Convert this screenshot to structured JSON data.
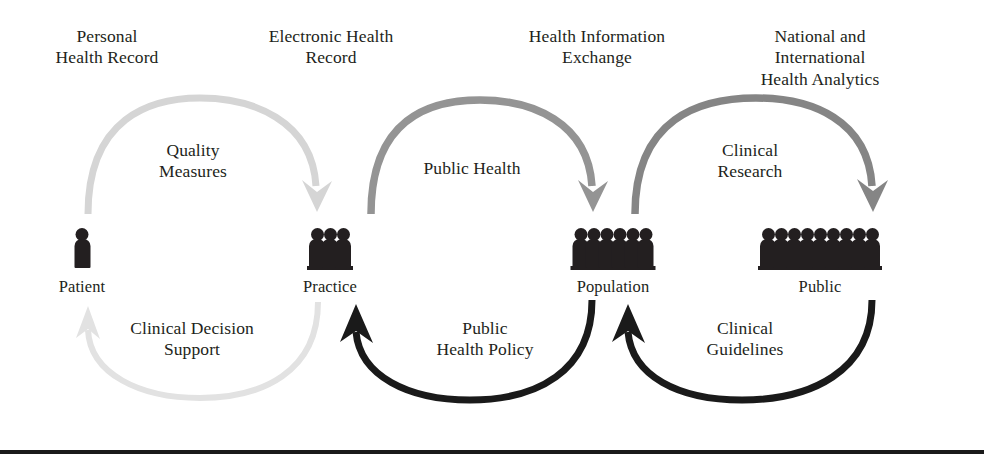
{
  "diagram": {
    "width": 984,
    "height": 463,
    "background": "#ffffff",
    "text_color": "#231f20",
    "rule_color": "#1a1a1a"
  },
  "tier_labels": [
    {
      "text": "Personal\nHealth Record",
      "x": 107,
      "y": 26
    },
    {
      "text": "Electronic Health\nRecord",
      "x": 331,
      "y": 26
    },
    {
      "text": "Health Information\nExchange",
      "x": 597,
      "y": 26
    },
    {
      "text": "National and International\nHealth Analytics",
      "x": 820,
      "y": 26
    }
  ],
  "flow_labels_forward": [
    {
      "text": "Quality\nMeasures",
      "x": 193,
      "y": 140
    },
    {
      "text": "Public Health",
      "x": 472,
      "y": 158
    },
    {
      "text": "Clinical\nResearch",
      "x": 750,
      "y": 140
    }
  ],
  "flow_labels_return": [
    {
      "text": "Clinical Decision\nSupport",
      "x": 192,
      "y": 318
    },
    {
      "text": "Public\nHealth Policy",
      "x": 485,
      "y": 318
    },
    {
      "text": "Clinical\nGuidelines",
      "x": 745,
      "y": 318
    }
  ],
  "actors": [
    {
      "name": "Patient",
      "label": "Patient",
      "x": 82,
      "y": 228,
      "count": 1,
      "figure_color": "#231f20",
      "label_y": 277
    },
    {
      "name": "Practice",
      "label": "Practice",
      "x": 330,
      "y": 228,
      "count": 3,
      "figure_color": "#231f20",
      "label_y": 277
    },
    {
      "name": "Population",
      "label": "Population",
      "x": 613,
      "y": 228,
      "count": 6,
      "figure_color": "#231f20",
      "label_y": 277
    },
    {
      "name": "Public",
      "label": "Public",
      "x": 820,
      "y": 228,
      "count": 9,
      "figure_color": "#231f20",
      "label_y": 277
    }
  ],
  "arrows_forward": [
    {
      "from": "Patient",
      "to": "Practice",
      "label": "Quality Measures",
      "color": "#d5d5d5",
      "width": 7
    },
    {
      "from": "Practice",
      "to": "Population",
      "label": "Public Health",
      "color": "#949494",
      "width": 7.5
    },
    {
      "from": "Population",
      "to": "Public",
      "label": "Clinical Research",
      "color": "#858585",
      "width": 7.5
    }
  ],
  "arrows_return": [
    {
      "from": "Practice",
      "to": "Patient",
      "label": "Clinical Decision Support",
      "color": "#e2e2e2",
      "width": 6
    },
    {
      "from": "Population",
      "to": "Practice",
      "label": "Public Health Policy",
      "color": "#1a1a1a",
      "width": 7
    },
    {
      "from": "Public",
      "to": "Population",
      "label": "Clinical Guidelines",
      "color": "#1a1a1a",
      "width": 7
    }
  ],
  "bottom_rule": {
    "y": 450,
    "height": 4,
    "color": "#1a1a1a"
  }
}
